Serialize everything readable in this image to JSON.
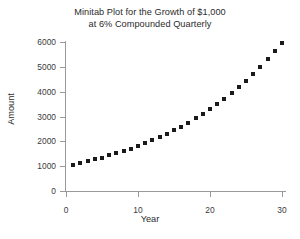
{
  "chart_data": {
    "type": "scatter",
    "title": "Minitab Plot for the Growth of $1,000 at 6% Compounded Quarterly",
    "title_lines": [
      "Minitab Plot for the Growth of $1,000",
      "at 6% Compounded Quarterly"
    ],
    "xlabel": "Year",
    "ylabel": "Amount",
    "xlim": [
      0,
      31
    ],
    "ylim": [
      0,
      6300
    ],
    "xticks": [
      0,
      10,
      20,
      30
    ],
    "xtick_labels": [
      "0",
      "10",
      "20",
      "30"
    ],
    "yticks": [
      0,
      1000,
      2000,
      3000,
      4000,
      5000,
      6000
    ],
    "ytick_labels": [
      "0",
      "1000",
      "2000",
      "3000",
      "4000",
      "5000",
      "6000"
    ],
    "grid": false,
    "legend": null,
    "marker": "filled-square",
    "marker_color": "#1a1a1a",
    "axis_color": "#9a9a9a",
    "background_color": "#ffffff",
    "x": [
      1,
      2,
      3,
      4,
      5,
      6,
      7,
      8,
      9,
      10,
      11,
      12,
      13,
      14,
      15,
      16,
      17,
      18,
      19,
      20,
      21,
      22,
      23,
      24,
      25,
      26,
      27,
      28,
      29,
      30
    ],
    "y": [
      1061,
      1127,
      1196,
      1269,
      1347,
      1430,
      1517,
      1610,
      1709,
      1814,
      1925,
      2043,
      2169,
      2302,
      2443,
      2593,
      2752,
      2921,
      3100,
      3291,
      3493,
      3707,
      3935,
      4176,
      4432,
      4704,
      4993,
      5300,
      5625,
      5970
    ],
    "series_name": "Amount"
  },
  "axis_titles": {
    "x": "Year",
    "y": "Amount"
  }
}
